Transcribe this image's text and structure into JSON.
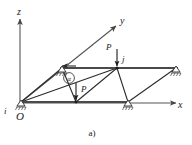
{
  "figure": {
    "caption": "a)"
  },
  "axes": {
    "z": {
      "label": "z"
    },
    "y": {
      "label": "y"
    },
    "x": {
      "label": "x"
    }
  },
  "nodes": {
    "origin": {
      "label": "O"
    },
    "i": {
      "label": "i"
    },
    "j": {
      "label": "j"
    }
  },
  "loads": [
    {
      "id": "load-upper",
      "label": "P"
    },
    {
      "id": "load-lower",
      "label": "P"
    }
  ],
  "angle_marker": {
    "label": "α"
  },
  "colors": {
    "member": "#2b2b2b",
    "chord": "#4a4a4a",
    "axis": "#555555",
    "text": "#1a1a1a",
    "background": "#ffffff"
  }
}
